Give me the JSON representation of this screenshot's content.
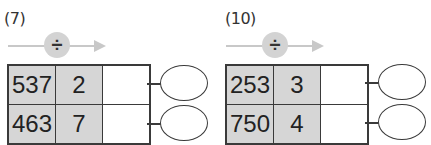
{
  "problems": [
    {
      "label": "(7)",
      "operator": "÷",
      "rows": [
        {
          "dividend": "537",
          "divisor": "2",
          "result": ""
        },
        {
          "dividend": "463",
          "divisor": "7",
          "result": ""
        }
      ]
    },
    {
      "label": "(10)",
      "operator": "÷",
      "rows": [
        {
          "dividend": "253",
          "divisor": "3",
          "result": ""
        },
        {
          "dividend": "750",
          "divisor": "4",
          "result": ""
        }
      ]
    }
  ]
}
